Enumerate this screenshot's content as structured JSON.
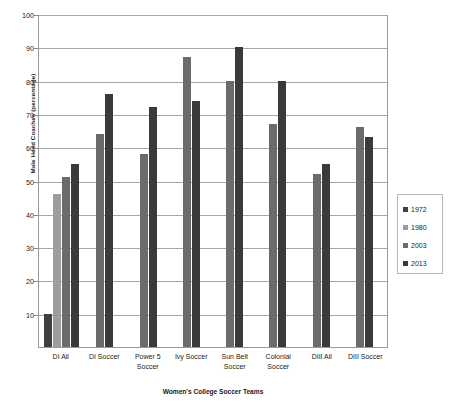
{
  "chart_data": {
    "type": "bar",
    "title": "",
    "xlabel": "Women's College Soccer Teams",
    "ylabel": "Male Head Coaches (percentage)",
    "ylim": [
      0,
      100
    ],
    "ytick_step": 10,
    "ytick_labels": [
      "100",
      "90",
      "80",
      "70",
      "60",
      "50",
      "40",
      "30",
      "20",
      "10",
      ""
    ],
    "grid": true,
    "legend_position": "right",
    "categories": [
      "DI All",
      "DI Soccer",
      "Power 5 Soccer",
      "Ivy Soccer",
      "Sun Belt Soccer",
      "Colonial Soccer",
      "DIII All",
      "DIII Soccer"
    ],
    "series": [
      {
        "name": "1972",
        "color": "#3f3f3f",
        "values": [
          10,
          null,
          null,
          null,
          null,
          null,
          null,
          null
        ]
      },
      {
        "name": "1980",
        "color": "#9d9d9d",
        "values": [
          46,
          null,
          null,
          null,
          null,
          null,
          null,
          null
        ]
      },
      {
        "name": "2003",
        "color": "#6b6b6b",
        "values": [
          51,
          64,
          58,
          87,
          80,
          67,
          52,
          66
        ]
      },
      {
        "name": "2013",
        "color": "#3a3a3a",
        "values": [
          55,
          76,
          72,
          74,
          90,
          80,
          55,
          63
        ]
      }
    ]
  },
  "legend": {
    "items": [
      {
        "label": "1972",
        "color": "#3f3f3f"
      },
      {
        "label": "1980",
        "color": "#9d9d9d"
      },
      {
        "label": "2003",
        "color": "#6b6b6b"
      },
      {
        "label": "2013",
        "color": "#3a3a3a"
      }
    ]
  },
  "axes": {
    "y_title": "Male Head Coaches (percentage)",
    "x_title": "Women's College Soccer Teams",
    "y_ticks": [
      "100",
      "90",
      "80",
      "70",
      "60",
      "50",
      "40",
      "30",
      "20",
      "10",
      "0"
    ]
  }
}
